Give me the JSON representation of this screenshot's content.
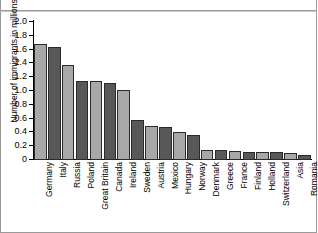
{
  "window": {
    "cut_off_title": ""
  },
  "chart_data": {
    "type": "bar",
    "title": "",
    "xlabel": "",
    "ylabel": "Number of immigrants in millions",
    "ylim": [
      0,
      2.0
    ],
    "ytick_labels": [
      "2.0",
      "1.8",
      "1.6",
      "1.4",
      "1.2",
      "1.0",
      "0.8",
      "0.6",
      "0.4",
      "0.2",
      "0"
    ],
    "ytick_values": [
      2.0,
      1.8,
      1.6,
      1.4,
      1.2,
      1.0,
      0.8,
      0.6,
      0.4,
      0.2,
      0
    ],
    "grid": false,
    "legend": false,
    "bar_colors": [
      "#a8a8a8",
      "#585858"
    ],
    "bar_edge_color": "#2b2b2b",
    "categories": [
      "Germany",
      "Italy",
      "Russia",
      "Poland",
      "Great Britain",
      "Canada",
      "Ireland",
      "Sweden",
      "Austria",
      "Mexico",
      "Hungary",
      "Norway",
      "Denmark",
      "Greece",
      "France",
      "Finland",
      "Holland",
      "Switzerland",
      "Asia",
      "Romania"
    ],
    "values": [
      1.68,
      1.64,
      1.38,
      1.14,
      1.14,
      1.12,
      1.02,
      0.58,
      0.5,
      0.48,
      0.4,
      0.36,
      0.15,
      0.14,
      0.13,
      0.12,
      0.12,
      0.11,
      0.1,
      0.07
    ]
  }
}
